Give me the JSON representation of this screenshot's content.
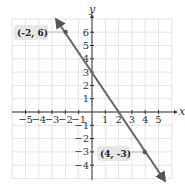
{
  "chart_data": {
    "type": "line",
    "title": "",
    "xlabel": "x",
    "ylabel": "y",
    "xlim": [
      -6,
      6
    ],
    "ylim": [
      -5,
      7
    ],
    "grid": true,
    "x_ticks": [
      "-5",
      "-4",
      "-3",
      "-2",
      "-1",
      "1",
      "2",
      "3",
      "4",
      "5"
    ],
    "y_ticks": [
      "6",
      "5",
      "4",
      "3",
      "2",
      "1",
      "-1",
      "-2",
      "-3",
      "-4"
    ],
    "series": [
      {
        "name": "line",
        "equation": "y = -1.5x + 3",
        "points": [
          [
            -2,
            6
          ],
          [
            4,
            -3
          ]
        ],
        "color": "#6b6b6b"
      }
    ],
    "annotations": [
      {
        "label": "(-2, 6)",
        "x": -2,
        "y": 6
      },
      {
        "label": "(4, -3)",
        "x": 4,
        "y": -3
      }
    ]
  }
}
